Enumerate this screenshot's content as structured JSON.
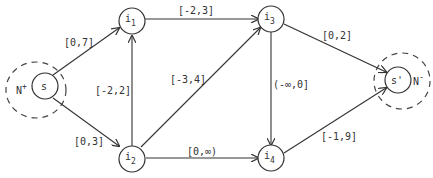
{
  "diagram": {
    "regions": {
      "source": {
        "label": "N",
        "sup": "+"
      },
      "sink": {
        "label": "N",
        "sup": "-"
      }
    },
    "nodes": {
      "s": {
        "label": "s",
        "sub": ""
      },
      "i1": {
        "label": "i",
        "sub": "1"
      },
      "i2": {
        "label": "i",
        "sub": "2"
      },
      "i3": {
        "label": "i",
        "sub": "3"
      },
      "i4": {
        "label": "i",
        "sub": "4"
      },
      "t": {
        "label": "s'",
        "sub": ""
      }
    },
    "edges": [
      {
        "from": "s",
        "to": "i1",
        "label": "[0,7]"
      },
      {
        "from": "s",
        "to": "i2",
        "label": "[0,3]"
      },
      {
        "from": "i2",
        "to": "i1",
        "label": "[-2,2]"
      },
      {
        "from": "i1",
        "to": "i3",
        "label": "[-2,3]"
      },
      {
        "from": "i2",
        "to": "i3",
        "label": "[-3,4]"
      },
      {
        "from": "i2",
        "to": "i4",
        "label": "[0,∞)"
      },
      {
        "from": "i3",
        "to": "i4",
        "label": "(-∞,0]"
      },
      {
        "from": "i3",
        "to": "s'",
        "label": "[0,2]"
      },
      {
        "from": "i4",
        "to": "s'",
        "label": "[-1,9]"
      }
    ]
  }
}
